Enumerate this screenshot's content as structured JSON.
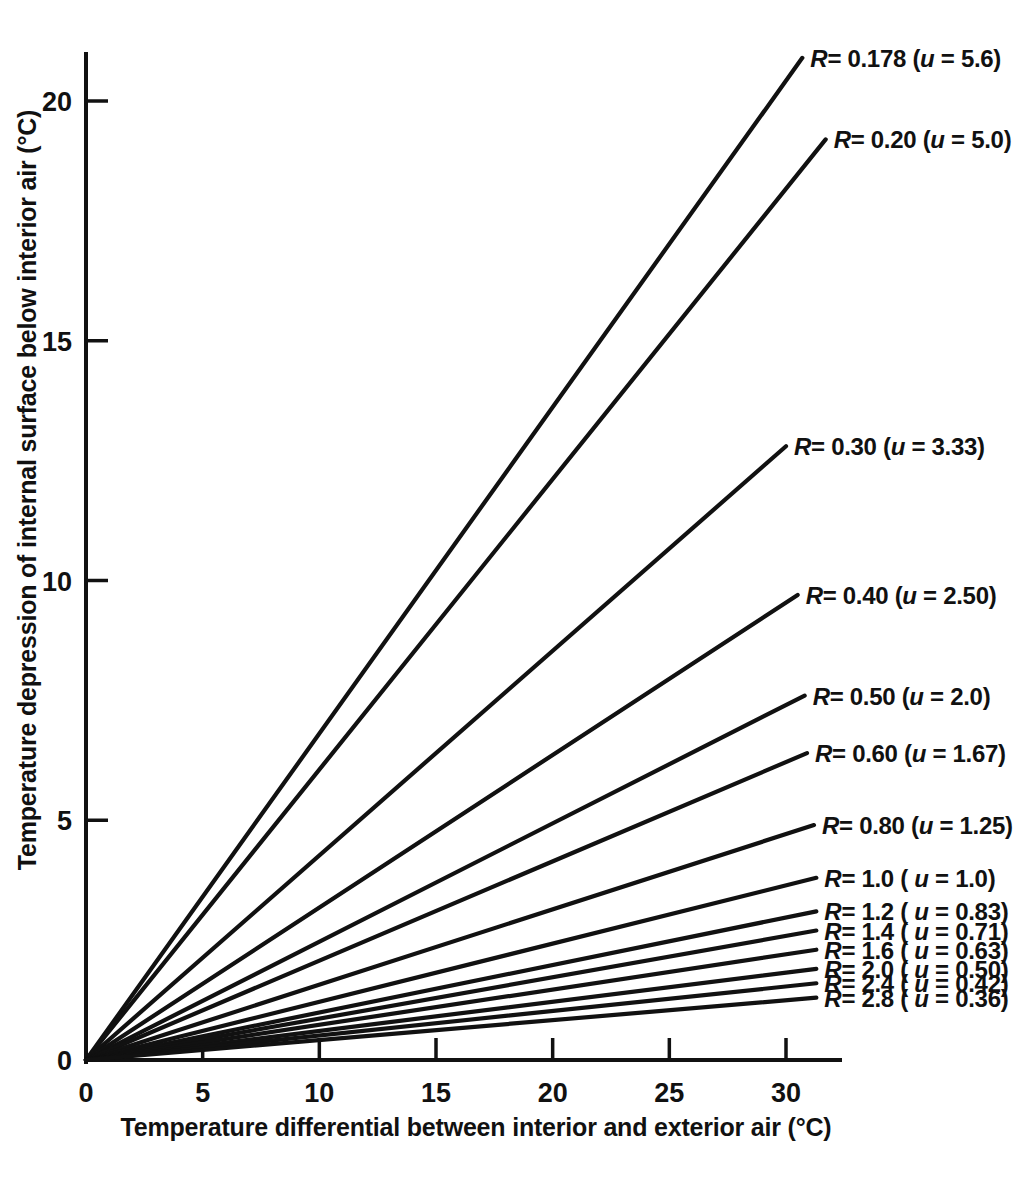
{
  "chart_data": {
    "type": "line",
    "title": "",
    "xlabel": "Temperature differential between interior and exterior air  (°C)",
    "ylabel": "Temperature depression of internal surface below interior air  (°C)",
    "xlim": [
      0,
      32
    ],
    "ylim": [
      0,
      21.5
    ],
    "xticks": [
      0,
      5,
      10,
      15,
      20,
      25,
      30
    ],
    "xticklabels": [
      "0",
      "5",
      "10",
      "15",
      "20",
      "25",
      "30"
    ],
    "yticks": [
      0,
      5,
      10,
      15,
      20
    ],
    "yticklabels": [
      "0",
      "5",
      "10",
      "15",
      "20"
    ],
    "grid": false,
    "legend_position": "inline-right-of-line-ends",
    "line_color": "#111111",
    "relation_note": "depression = differential x (0.1212 / R)",
    "series": [
      {
        "name": "R= 0.178 (u = 5.6)",
        "R": 0.178,
        "u": 5.6,
        "slope": 0.681,
        "x_end": 30.7,
        "y_end": 20.9,
        "label_text": "R= 0.178 (u = 5.6)",
        "label_R": "R",
        "label_u": "u"
      },
      {
        "name": "R= 0.20 (u = 5.0)",
        "R": 0.2,
        "u": 5.0,
        "slope": 0.606,
        "x_end": 31.7,
        "y_end": 19.2,
        "label_text": "R= 0.20 (u = 5.0)"
      },
      {
        "name": "R= 0.30 (u = 3.33)",
        "R": 0.3,
        "u": 3.33,
        "slope": 0.404,
        "x_end": 30.0,
        "y_end": 12.8,
        "label_text": "R= 0.30 (u = 3.33)"
      },
      {
        "name": "R= 0.40 (u = 2.50)",
        "R": 0.4,
        "u": 2.5,
        "slope": 0.303,
        "x_end": 30.5,
        "y_end": 9.7,
        "label_text": "R= 0.40 (u = 2.50)"
      },
      {
        "name": "R= 0.50 (u = 2.0)",
        "R": 0.5,
        "u": 2.0,
        "slope": 0.242,
        "x_end": 30.8,
        "y_end": 7.6,
        "label_text": "R= 0.50 (u = 2.0)"
      },
      {
        "name": "R= 0.60 (u = 1.67)",
        "R": 0.6,
        "u": 1.67,
        "slope": 0.202,
        "x_end": 30.9,
        "y_end": 6.4,
        "label_text": "R= 0.60 (u = 1.67)"
      },
      {
        "name": "R= 0.80 (u = 1.25)",
        "R": 0.8,
        "u": 1.25,
        "slope": 0.1515,
        "x_end": 31.2,
        "y_end": 4.9,
        "label_text": "R= 0.80 (u = 1.25)"
      },
      {
        "name": "R= 1.0 (u = 1.0)",
        "R": 1.0,
        "u": 1.0,
        "slope": 0.1212,
        "x_end": 31.3,
        "y_end": 3.8,
        "label_text": "R= 1.0 ( u = 1.0)"
      },
      {
        "name": "R= 1.2 (u = 0.83)",
        "R": 1.2,
        "u": 0.83,
        "slope": 0.101,
        "x_end": 31.3,
        "y_end": 3.1,
        "label_text": "R= 1.2 ( u = 0.83)"
      },
      {
        "name": "R= 1.4 (u = 0.71)",
        "R": 1.4,
        "u": 0.71,
        "slope": 0.0866,
        "x_end": 31.3,
        "y_end": 2.7,
        "label_text": "R= 1.4 ( u = 0.71)"
      },
      {
        "name": "R= 1.6 (u = 0.63)",
        "R": 1.6,
        "u": 0.63,
        "slope": 0.0758,
        "x_end": 31.3,
        "y_end": 2.3,
        "label_text": "R= 1.6 ( u = 0.63)"
      },
      {
        "name": "R= 2.0 (u = 0.50)",
        "R": 2.0,
        "u": 0.5,
        "slope": 0.0606,
        "x_end": 31.3,
        "y_end": 1.9,
        "label_text": "R= 2.0 ( u = 0.50)"
      },
      {
        "name": "R= 2.4 (u = 0.42)",
        "R": 2.4,
        "u": 0.42,
        "slope": 0.0505,
        "x_end": 31.3,
        "y_end": 1.6,
        "label_text": "R= 2.4 ( u = 0.42)"
      },
      {
        "name": "R= 2.8 (u = 0.36)",
        "R": 2.8,
        "u": 0.36,
        "slope": 0.0433,
        "x_end": 31.3,
        "y_end": 1.3,
        "label_text": "R= 2.8 ( u = 0.36)"
      }
    ]
  }
}
